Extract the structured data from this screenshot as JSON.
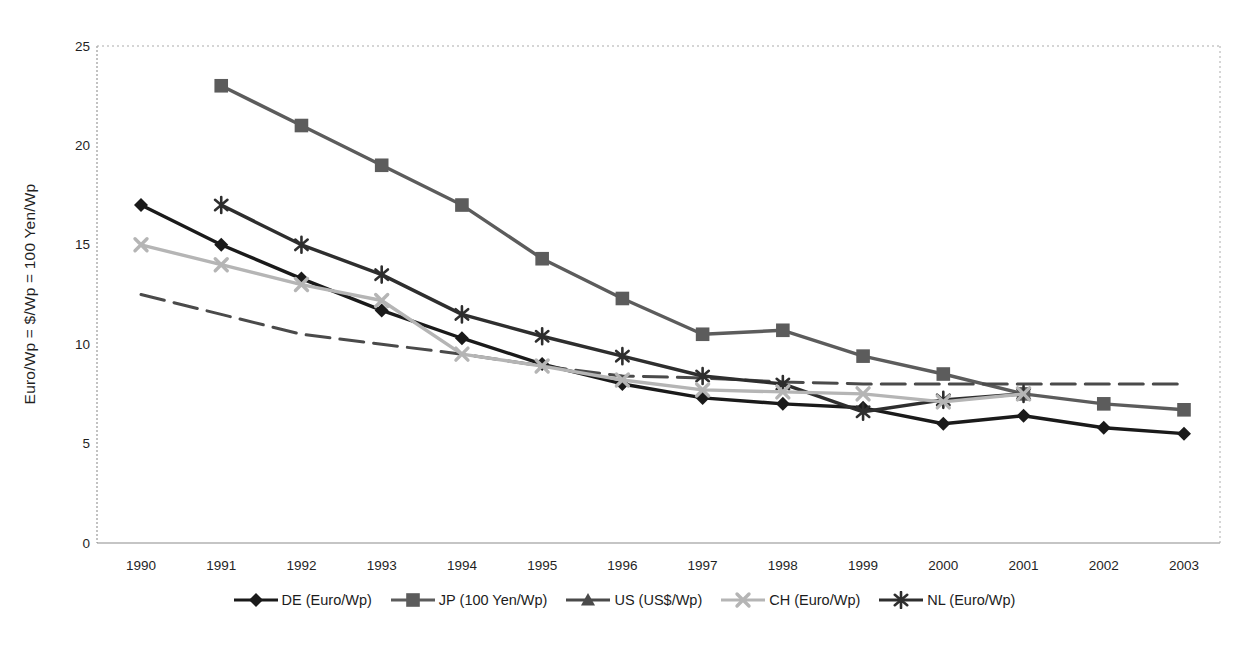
{
  "page": {
    "background_color": "#ffffff"
  },
  "axes": {
    "y_title": "Euro/Wp = $/Wp = 100 Yen/Wp"
  },
  "chart_data": {
    "type": "line",
    "title": "",
    "xlabel": "",
    "ylabel": "Euro/Wp = $/Wp = 100 Yen/Wp",
    "ylim": [
      0,
      25
    ],
    "yticks": [
      0,
      5,
      10,
      15,
      20,
      25
    ],
    "grid": false,
    "legend_position": "bottom",
    "categories": [
      "1990",
      "1991",
      "1992",
      "1993",
      "1994",
      "1995",
      "1996",
      "1997",
      "1998",
      "1999",
      "2000",
      "2001",
      "2002",
      "2003"
    ],
    "series": [
      {
        "name": "DE (Euro/Wp)",
        "marker": "diamond",
        "line_style": "solid",
        "color": "#1a1a1a",
        "show_markers_in_plot": true,
        "values": [
          17.0,
          15.0,
          13.3,
          11.7,
          10.3,
          9.0,
          8.0,
          7.3,
          7.0,
          6.8,
          6.0,
          6.4,
          5.8,
          5.5
        ]
      },
      {
        "name": "JP (100 Yen/Wp)",
        "marker": "square",
        "line_style": "solid",
        "color": "#5c5c5c",
        "show_markers_in_plot": true,
        "values": [
          null,
          23.0,
          21.0,
          19.0,
          17.0,
          14.3,
          12.3,
          10.5,
          10.7,
          9.4,
          8.5,
          7.5,
          7.0,
          6.7
        ]
      },
      {
        "name": "US (US$/Wp)",
        "marker": "triangle",
        "line_style": "dashed",
        "color": "#4a4a4a",
        "show_markers_in_plot": false,
        "values": [
          12.5,
          11.5,
          10.5,
          10.0,
          9.5,
          8.9,
          8.4,
          8.3,
          8.1,
          8.0,
          8.0,
          8.0,
          8.0,
          8.0
        ]
      },
      {
        "name": "NL (Euro/Wp)",
        "marker": "star",
        "line_style": "solid",
        "color": "#2e2e2e",
        "show_markers_in_plot": true,
        "values": [
          null,
          17.0,
          15.0,
          13.5,
          11.5,
          10.4,
          9.4,
          8.4,
          8.0,
          6.6,
          7.2,
          7.5,
          null,
          null
        ]
      },
      {
        "name": "CH (Euro/Wp)",
        "marker": "x",
        "line_style": "solid",
        "color": "#b5b5b5",
        "show_markers_in_plot": true,
        "values": [
          15.0,
          14.0,
          13.0,
          12.2,
          9.5,
          8.9,
          8.2,
          7.7,
          7.6,
          7.5,
          7.1,
          7.5,
          null,
          null
        ]
      }
    ],
    "legend_order": [
      "DE (Euro/Wp)",
      "JP (100 Yen/Wp)",
      "US (US$/Wp)",
      "CH (Euro/Wp)",
      "NL (Euro/Wp)"
    ]
  },
  "layout_hints": {
    "plot_left_px": 97,
    "plot_right_px": 1220,
    "plot_top_px": 46,
    "plot_bottom_px": 543
  }
}
